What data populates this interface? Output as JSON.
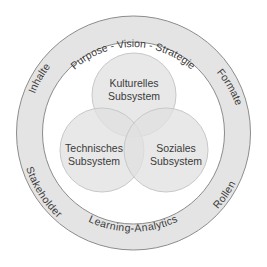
{
  "diagram": {
    "type": "ring-with-venn",
    "colors": {
      "ring_fill": "#e4e4e4",
      "ring_stroke": "#8c8c8c",
      "circle_fill": "#e6e6e6",
      "circle_stroke": "#c8c8c8",
      "text": "#3a3a3a",
      "background": "#ffffff"
    },
    "ring_labels": {
      "top": "Purpose - Vision - Strategie",
      "upper_left": "Inhalte",
      "upper_right": "Formate",
      "lower_left": "Stakeholder",
      "lower_right": "Rollen",
      "bottom": "Learning-Analytics"
    },
    "circles": [
      {
        "id": "kulturell",
        "line1": "Kulturelles",
        "line2": "Subsystem"
      },
      {
        "id": "technisch",
        "line1": "Technisches",
        "line2": "Subsystem"
      },
      {
        "id": "sozial",
        "line1": "Soziales",
        "line2": "Subsystem"
      }
    ]
  }
}
